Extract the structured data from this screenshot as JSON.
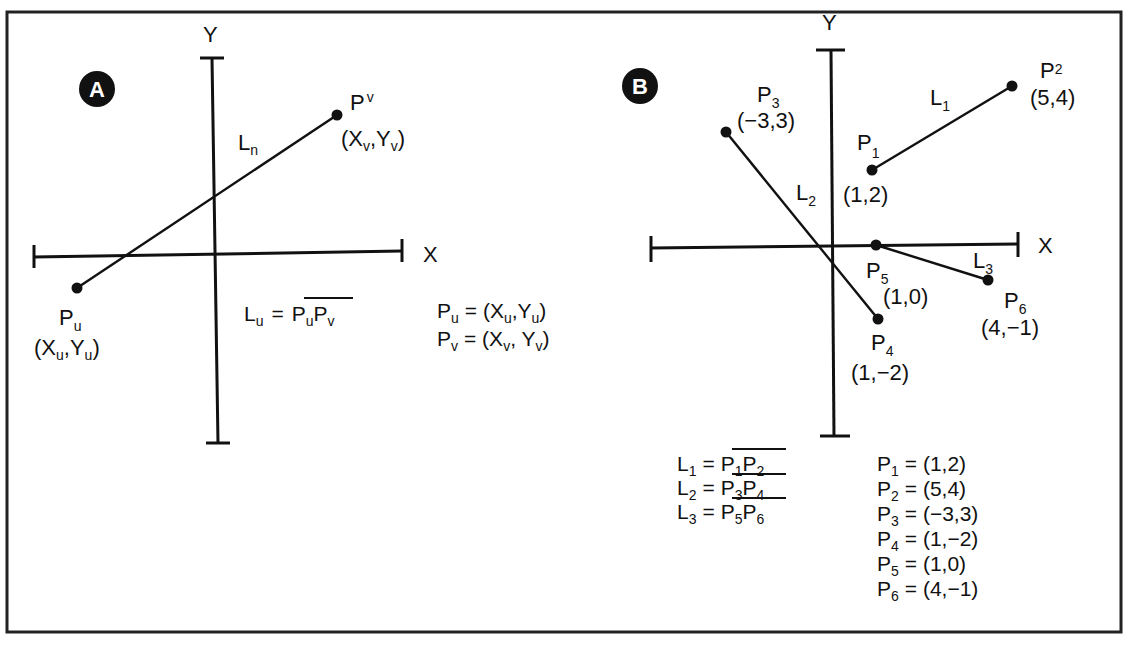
{
  "panel_a": {
    "badge": "A",
    "x_axis_label": "X",
    "y_axis_label": "Y",
    "line_label": {
      "main": "L",
      "sub": "n"
    },
    "points": [
      {
        "id": "Pu",
        "name_main": "P",
        "name_sub": "u",
        "coord_open": "(X",
        "coord_sub1": "u",
        "coord_mid": ",Y",
        "coord_sub2": "u",
        "coord_close": ")"
      },
      {
        "id": "Pv",
        "name_main": "P",
        "name_sub": "v",
        "coord_open": "(X",
        "coord_sub1": "v",
        "coord_mid": ",Y",
        "coord_sub2": "v",
        "coord_close": ")"
      }
    ],
    "segment_definition": {
      "lhs_main": "L",
      "lhs_sub": "u",
      "equals": "=",
      "p1_main": "P",
      "p1_sub": "u",
      "p2_main": "P",
      "p2_sub": "v"
    },
    "point_definitions": [
      {
        "lhs_main": "P",
        "lhs_sub": "u",
        "rhs_open": "= (X",
        "rhs_sub1": "u",
        "rhs_mid": ",Y",
        "rhs_sub2": "u",
        "rhs_close": ")"
      },
      {
        "lhs_main": "P",
        "lhs_sub": "v",
        "rhs_open": "= (X",
        "rhs_sub1": "v",
        "rhs_mid": ", Y",
        "rhs_sub2": "v",
        "rhs_close": ")"
      }
    ]
  },
  "panel_b": {
    "badge": "B",
    "x_axis_label": "X",
    "y_axis_label": "Y",
    "points": [
      {
        "id": "P1",
        "name_main": "P",
        "name_sub": "1",
        "coord": "(1,2)"
      },
      {
        "id": "P2",
        "name_main": "P",
        "name_sub": "2",
        "coord": "(5,4)"
      },
      {
        "id": "P3",
        "name_main": "P",
        "name_sub": "3",
        "coord": "(−3,3)"
      },
      {
        "id": "P4",
        "name_main": "P",
        "name_sub": "4",
        "coord": "(1,−2)"
      },
      {
        "id": "P5",
        "name_main": "P",
        "name_sub": "5",
        "coord": "(1,0)"
      },
      {
        "id": "P6",
        "name_main": "P",
        "name_sub": "6",
        "coord": "(4,−1)"
      }
    ],
    "lines": [
      {
        "id": "L1",
        "main": "L",
        "sub": "1",
        "from": "P1",
        "to": "P2"
      },
      {
        "id": "L2",
        "main": "L",
        "sub": "2",
        "from": "P3",
        "to": "P4"
      },
      {
        "id": "L3",
        "main": "L",
        "sub": "3",
        "from": "P5",
        "to": "P6"
      }
    ],
    "segment_definitions": [
      {
        "lhs_main": "L",
        "lhs_sub": "1",
        "equals": "=",
        "p1_main": "P",
        "p1_sub": "1",
        "p2_main": "P",
        "p2_sub": "2"
      },
      {
        "lhs_main": "L",
        "lhs_sub": "2",
        "equals": "=",
        "p1_main": "P",
        "p1_sub": "3",
        "p2_main": "P",
        "p2_sub": "4"
      },
      {
        "lhs_main": "L",
        "lhs_sub": "3",
        "equals": "=",
        "p1_main": "P",
        "p1_sub": "5",
        "p2_main": "P",
        "p2_sub": "6"
      }
    ],
    "point_definitions": [
      {
        "lhs_main": "P",
        "lhs_sub": "1",
        "rhs": "= (1,2)"
      },
      {
        "lhs_main": "P",
        "lhs_sub": "2",
        "rhs": "= (5,4)"
      },
      {
        "lhs_main": "P",
        "lhs_sub": "3",
        "rhs": "= (−3,3)"
      },
      {
        "lhs_main": "P",
        "lhs_sub": "4",
        "rhs": "= (1,−2)"
      },
      {
        "lhs_main": "P",
        "lhs_sub": "5",
        "rhs": "= (1,0)"
      },
      {
        "lhs_main": "P",
        "lhs_sub": "6",
        "rhs": "= (4,−1)"
      }
    ]
  },
  "colors": {
    "ink": "#111111",
    "background": "#ffffff",
    "badge_text": "#ffffff"
  }
}
